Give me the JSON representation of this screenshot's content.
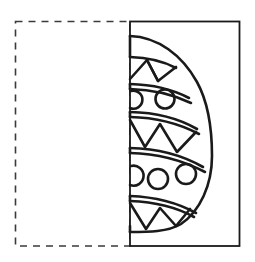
{
  "worksheet": {
    "title": "Symmetry drawing worksheet",
    "description": "Half of a decorated Easter egg drawn on the right panel; the left dashed panel is blank for the mirrored half to be completed.",
    "ink_color": "#1a1a1a",
    "paper_color": "#ffffff"
  },
  "left_panel": {
    "name": "blank-mirror-panel",
    "border_style": "dashed",
    "border_color": "#3a3a3a",
    "fill": "#ffffff",
    "x": 15,
    "y": 21,
    "width": 115,
    "height": 225,
    "dash_pattern": "7 6",
    "content": ""
  },
  "right_panel": {
    "name": "egg-half-panel",
    "border_style": "solid",
    "border_color": "#1a1a1a",
    "fill": "#ffffff",
    "x": 130,
    "y": 21,
    "width": 110,
    "height": 225
  },
  "fold_line": {
    "name": "symmetry-axis",
    "x": 130,
    "y_top": 21,
    "y_bottom": 246,
    "orientation": "vertical"
  },
  "egg": {
    "name": "easter-egg-half",
    "side": "right",
    "outline_color": "#1a1a1a",
    "stroke_width": 2.6,
    "axis_x": 130,
    "top_y": 36,
    "bottom_y": 232,
    "max_x": 212,
    "widest_y": 160,
    "bands": [
      {
        "index": 0,
        "type": "plain",
        "label": "top-plain-band",
        "y_start": 36,
        "y_end": 57
      },
      {
        "index": 1,
        "type": "triangles",
        "label": "upper-triangle-band",
        "y_start": 57,
        "y_end": 84,
        "triangle_count": 2
      },
      {
        "index": 2,
        "type": "circles",
        "label": "upper-circle-band",
        "y_start": 84,
        "y_end": 112,
        "full_circles": 1,
        "half_circles": 1
      },
      {
        "index": 3,
        "type": "triangles",
        "label": "middle-triangle-band",
        "y_start": 115,
        "y_end": 150,
        "triangle_count": 3
      },
      {
        "index": 4,
        "type": "circles",
        "label": "lower-circle-band",
        "y_start": 153,
        "y_end": 196,
        "full_circles": 2,
        "half_circles": 1
      },
      {
        "index": 5,
        "type": "triangles",
        "label": "bottom-triangle-band",
        "y_start": 199,
        "y_end": 232,
        "triangle_count": 3
      }
    ]
  }
}
